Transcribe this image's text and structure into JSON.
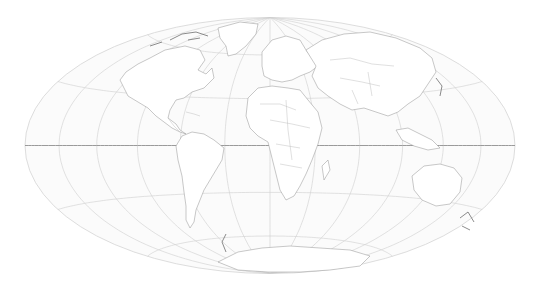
{
  "map": {
    "projection": "Hammer",
    "center": {
      "x": 270,
      "y": 145.5
    },
    "radius": {
      "rx": 245,
      "ry": 128
    },
    "graticule": {
      "meridian_step_deg": 30,
      "parallel_step_deg": 30,
      "equator_emphasized": true
    },
    "colors": {
      "background": "#ffffff",
      "globe_fill": "#fbfbfb",
      "graticule": "#cfcfcf",
      "equator": "#8e8e8e",
      "coastline": "#9a9a9a",
      "borders": "#b9b9b9"
    },
    "regions": [
      {
        "name": "North America"
      },
      {
        "name": "Greenland"
      },
      {
        "name": "South America"
      },
      {
        "name": "Europe"
      },
      {
        "name": "Africa"
      },
      {
        "name": "Asia"
      },
      {
        "name": "Australia"
      },
      {
        "name": "Antarctica"
      }
    ]
  }
}
